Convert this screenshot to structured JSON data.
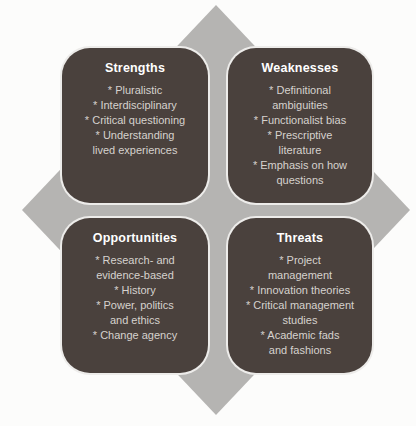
{
  "figure": {
    "type": "swot-diagram",
    "colors": {
      "background": "#fcfcfb",
      "diamond": "#b5b4b2",
      "quadrant_box": "#4a413d",
      "title_text": "#ffffff",
      "item_text": "#d6d2ce"
    },
    "quadrants": [
      {
        "id": "strengths",
        "title": "Strengths",
        "items": [
          "* Pluralistic",
          "* Interdisciplinary",
          "* Critical questioning",
          "* Understanding\nlived experiences"
        ]
      },
      {
        "id": "weaknesses",
        "title": "Weaknesses",
        "items": [
          "* Definitional\nambiguities",
          "* Functionalist bias",
          "* Prescriptive\nliterature",
          "* Emphasis on how\nquestions"
        ]
      },
      {
        "id": "opportunities",
        "title": "Opportunities",
        "items": [
          "* Research- and\nevidence-based",
          "* History",
          "* Power, politics\nand ethics",
          "* Change agency"
        ]
      },
      {
        "id": "threats",
        "title": "Threats",
        "items": [
          "* Project\nmanagement",
          "* Innovation theories",
          "* Critical management\nstudies",
          "* Academic fads\nand fashions"
        ]
      }
    ]
  }
}
